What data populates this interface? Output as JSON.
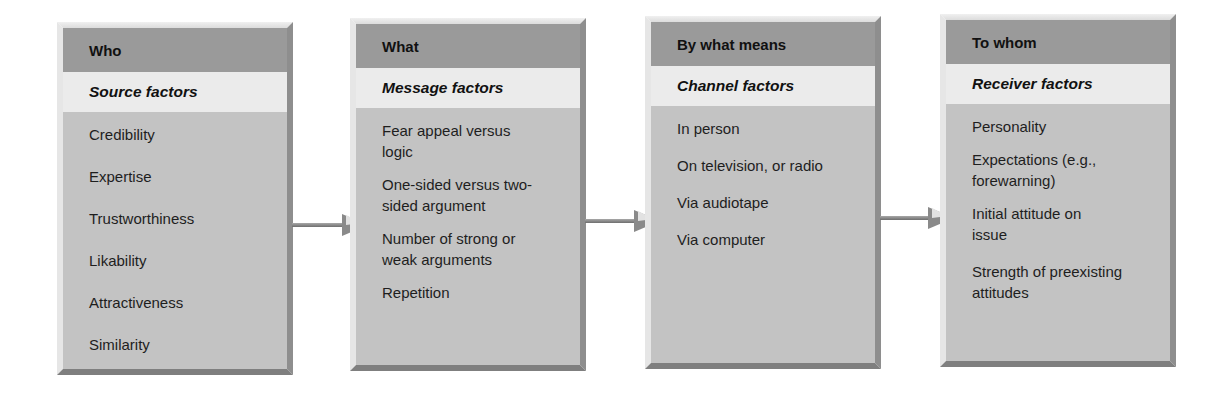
{
  "diagram": {
    "type": "flow",
    "direction": "left-to-right",
    "colors": {
      "header_bg": "#9a9a9a",
      "subheader_bg": "#ebebeb",
      "body_bg": "#c3c3c3",
      "arrow": "#8a8a8a"
    },
    "boxes": [
      {
        "header": "Who",
        "subheader": "Source factors",
        "items": [
          "Credibility",
          "Expertise",
          "Trustworthiness",
          "Likability",
          "Attractiveness",
          "Similarity"
        ]
      },
      {
        "header": "What",
        "subheader": "Message factors",
        "items": [
          "Fear appeal versus logic",
          "One-sided versus two-sided argument",
          "Number of strong or weak arguments",
          "Repetition"
        ]
      },
      {
        "header": "By what means",
        "subheader": "Channel factors",
        "items": [
          "In person",
          "On television, or radio",
          "Via audiotape",
          "Via computer"
        ]
      },
      {
        "header": "To whom",
        "subheader": "Receiver factors",
        "items": [
          "Personality",
          "Expectations (e.g., forewarning)",
          "Initial attitude on issue",
          "Strength of preexisting attitudes"
        ]
      }
    ],
    "arrows": [
      {
        "from": 0,
        "to": 1
      },
      {
        "from": 1,
        "to": 2
      },
      {
        "from": 2,
        "to": 3
      }
    ]
  }
}
